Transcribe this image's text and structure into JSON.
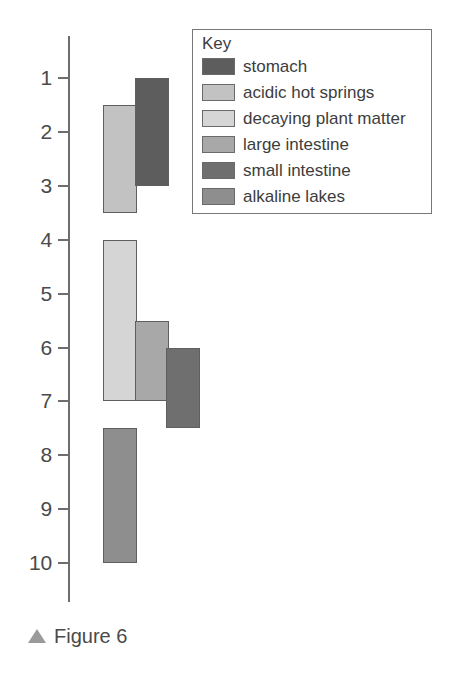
{
  "caption": {
    "marker": "triangle-up",
    "text": "Figure 6"
  },
  "legend": {
    "title": "Key",
    "items": [
      {
        "label": "stomach",
        "color": "#5d5d5d"
      },
      {
        "label": "acidic hot springs",
        "color": "#c2c2c2"
      },
      {
        "label": "decaying plant matter",
        "color": "#d5d5d5"
      },
      {
        "label": "large intestine",
        "color": "#a8a8a8"
      },
      {
        "label": "small intestine",
        "color": "#6f6f6f"
      },
      {
        "label": "alkaline lakes",
        "color": "#8e8e8e"
      }
    ]
  },
  "chart_data": {
    "type": "bar",
    "orientation": "vertical-range",
    "title": "",
    "xlabel": "",
    "ylabel": "",
    "ylim": [
      1,
      10
    ],
    "y_inverted": true,
    "grid": false,
    "legend_position": "top-right",
    "tick_labels": [
      "1",
      "2",
      "3",
      "4",
      "5",
      "6",
      "7",
      "8",
      "9",
      "10"
    ],
    "tick_values": [
      1,
      2,
      3,
      4,
      5,
      6,
      7,
      8,
      9,
      10
    ],
    "categories": [
      "stomach",
      "acidic hot springs",
      "decaying plant matter",
      "large intestine",
      "small intestine",
      "alkaline lakes"
    ],
    "bars": [
      {
        "name": "acidic hot springs",
        "start": 1.5,
        "end": 3.5,
        "color": "#c2c2c2",
        "column": 0
      },
      {
        "name": "stomach",
        "start": 1.0,
        "end": 3.0,
        "color": "#5d5d5d",
        "column": 1
      },
      {
        "name": "decaying plant matter",
        "start": 4.0,
        "end": 7.0,
        "color": "#d5d5d5",
        "column": 0
      },
      {
        "name": "large intestine",
        "start": 5.5,
        "end": 7.0,
        "color": "#a8a8a8",
        "column": 1
      },
      {
        "name": "small intestine",
        "start": 6.0,
        "end": 7.5,
        "color": "#6f6f6f",
        "column": 2
      },
      {
        "name": "alkaline lakes",
        "start": 7.5,
        "end": 10.0,
        "color": "#8e8e8e",
        "column": 0
      }
    ]
  }
}
